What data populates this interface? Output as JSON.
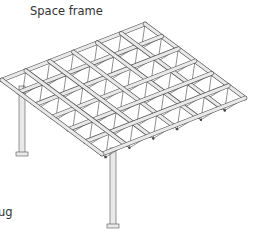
{
  "diagram": {
    "title": "Space frame",
    "cut_label_fragment": "ug",
    "grid": {
      "cols": 6,
      "rows": 6
    },
    "colors": {
      "member": "#e9e9e9",
      "outline": "#555555",
      "brace": "#444444"
    }
  }
}
